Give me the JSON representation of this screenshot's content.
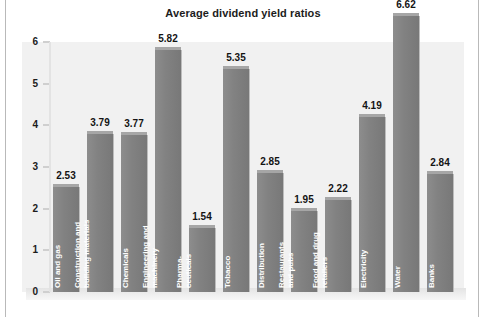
{
  "chart_data": {
    "type": "bar",
    "title": "Average dividend yield ratios",
    "xlabel": "",
    "ylabel": "",
    "ylim": [
      0,
      6
    ],
    "yticks": [
      "6",
      "5",
      "4",
      "3",
      "2",
      "1",
      "0"
    ],
    "grid": false,
    "legend": "none",
    "bar_color": "#828282",
    "panel_color": "#f1f1f1",
    "categories": [
      "Oil and gas",
      "Construction and building materials",
      "Chemicals",
      "Engineering and machinery",
      "Pharma-ceuticals",
      "Tobacco",
      "Distribution",
      "Restaurants and pubs",
      "Food and drug retailers",
      "Electricity",
      "Water",
      "Banks"
    ],
    "values": [
      2.53,
      3.79,
      3.77,
      5.82,
      1.54,
      5.35,
      2.85,
      1.95,
      2.22,
      4.19,
      6.62,
      2.84
    ],
    "value_labels": [
      "2.53",
      "3.79",
      "3.77",
      "5.82",
      "1.54",
      "5.35",
      "2.85",
      "1.95",
      "2.22",
      "4.19",
      "6.62",
      "2.84"
    ],
    "category_lines": [
      [
        "Oil and gas"
      ],
      [
        "Construction and",
        "building materials"
      ],
      [
        "Chemicals"
      ],
      [
        "Engineering and",
        "machinery"
      ],
      [
        "Pharma-",
        "ceuticals"
      ],
      [
        "Tobacco"
      ],
      [
        "Distribution"
      ],
      [
        "Restaurants",
        "and pubs"
      ],
      [
        "Food and drug",
        "retailers"
      ],
      [
        "Electricity"
      ],
      [
        "Water"
      ],
      [
        "Banks"
      ]
    ]
  }
}
